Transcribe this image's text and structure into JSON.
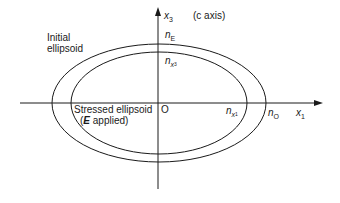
{
  "diagram": {
    "type": "index-ellipsoid",
    "axes": {
      "x3": {
        "symbol": "x",
        "subscript": "3",
        "note": "(c axis)"
      },
      "x1": {
        "symbol": "x",
        "subscript": "1"
      },
      "origin": "O"
    },
    "ellipses": [
      {
        "id": "initial",
        "label_line1": "Initial",
        "label_line2": "ellipsoid",
        "vertical_index": {
          "symbol": "n",
          "subscript": "E"
        },
        "horizontal_index": {
          "symbol": "n",
          "subscript": "O"
        }
      },
      {
        "id": "stressed",
        "label_line1": "Stressed ellipsoid",
        "label_line2_prefix": "(",
        "label_line2_bold": "E",
        "label_line2_suffix": " applied)",
        "vertical_index": {
          "symbol": "n",
          "subscript": "x",
          "subsubscript": "3"
        },
        "horizontal_index": {
          "symbol": "n",
          "subscript": "x",
          "subsubscript": "1"
        }
      }
    ],
    "colors": {
      "stroke": "#1a1a1a",
      "background": "#ffffff"
    }
  }
}
